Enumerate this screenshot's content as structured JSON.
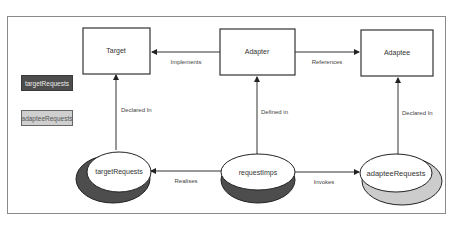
{
  "diagram": {
    "colors": {
      "border": "#333333",
      "dark_fill": "#4d4d4d",
      "light_fill": "#cccccc",
      "node_fill": "#ffffff",
      "edge": "#333333",
      "label": "#444444"
    },
    "boxes": [
      {
        "id": "target",
        "label": "Target"
      },
      {
        "id": "adapter",
        "label": "Adapter"
      },
      {
        "id": "adaptee",
        "label": "Adaptee"
      }
    ],
    "ellipses": [
      {
        "id": "targetRequests",
        "label": "targetRequests",
        "shade": "dark"
      },
      {
        "id": "requestImps",
        "label": "requestImps",
        "shade": "dark"
      },
      {
        "id": "adapteeRequests",
        "label": "adapteeRequests",
        "shade": "light"
      }
    ],
    "edges": [
      {
        "from": "adapter",
        "to": "target",
        "label": "Implements"
      },
      {
        "from": "adapter",
        "to": "adaptee",
        "label": "References"
      },
      {
        "from": "targetRequests",
        "to": "target",
        "label": "Declared In"
      },
      {
        "from": "requestImps",
        "to": "adapter",
        "label": "Defined in"
      },
      {
        "from": "adapteeRequests",
        "to": "adaptee",
        "label": "Declared In"
      },
      {
        "from": "requestImps",
        "to": "targetRequests",
        "label": "Realises"
      },
      {
        "from": "requestImps",
        "to": "adapteeRequests",
        "label": "Invokes"
      }
    ],
    "legend": [
      {
        "label": "targetRequests",
        "shade": "dark"
      },
      {
        "label": "adapteeRequests",
        "shade": "light"
      }
    ]
  }
}
